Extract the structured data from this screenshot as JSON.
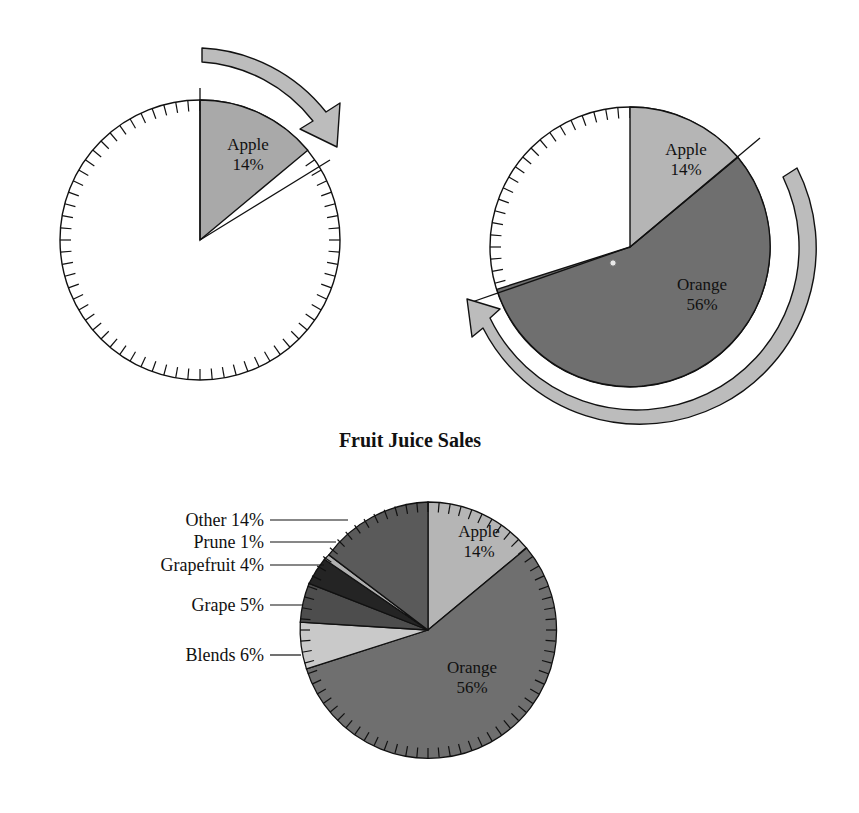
{
  "figure": {
    "title": "Fruit Juice Sales",
    "clipped_header_text": "ggg g ggg g g ggg"
  },
  "colors": {
    "apple": "#a9a9a9",
    "apple_light": "#b5b5b5",
    "orange": "#6f6f6f",
    "blends": "#c9c9c9",
    "grape": "#4d4d4d",
    "grapefruit": "#242424",
    "prune": "#b0b0b0",
    "other": "#5a5a5a",
    "outline": "#111111",
    "arrow_fill": "#bcbcbc",
    "arrow_outline": "#111111",
    "background": "#ffffff"
  },
  "panels": [
    {
      "name": "panel-step-1",
      "center": {
        "x": 200,
        "y": 240
      },
      "radius": 140,
      "slices": [
        {
          "key": "apple",
          "label": "Apple",
          "percent_label": "14%",
          "value": 14,
          "color": "#a9a9a9",
          "start_deg": 0,
          "end_deg": 50.4,
          "label_x": 248,
          "label_y": 150
        }
      ],
      "arrow": {
        "name": "rotation-arrow-apple",
        "direction": "clockwise",
        "from_deg": 0,
        "to_deg": 50.4
      }
    },
    {
      "name": "panel-step-2",
      "center": {
        "x": 630,
        "y": 247
      },
      "radius": 140,
      "slices": [
        {
          "key": "apple",
          "label": "Apple",
          "percent_label": "14%",
          "value": 14,
          "color": "#b5b5b5",
          "start_deg": 0,
          "end_deg": 50.4,
          "label_x": 684,
          "label_y": 152
        },
        {
          "key": "orange",
          "label": "Orange",
          "percent_label": "56%",
          "value": 56,
          "color": "#6f6f6f",
          "start_deg": 50.4,
          "end_deg": 252.0,
          "label_x": 700,
          "label_y": 290
        }
      ],
      "arrow": {
        "name": "rotation-arrow-orange",
        "direction": "clockwise",
        "from_deg": 50.4,
        "to_deg": 252.0
      }
    },
    {
      "name": "panel-final-pie",
      "center": {
        "x": 428,
        "y": 630
      },
      "radius": 128,
      "title_position": {
        "x": 410,
        "y": 447
      },
      "slices": [
        {
          "key": "apple",
          "label": "Apple",
          "percent_label": "14%",
          "value": 14,
          "color": "#b5b5b5",
          "start_deg": 0,
          "end_deg": 50.4,
          "label_x": 477,
          "label_y": 534,
          "label_mode": "inside"
        },
        {
          "key": "orange",
          "label": "Orange",
          "percent_label": "56%",
          "value": 56,
          "color": "#6f6f6f",
          "start_deg": 50.4,
          "end_deg": 252.0,
          "label_x": 470,
          "label_y": 672,
          "label_mode": "inside"
        },
        {
          "key": "blends",
          "label": "Blends",
          "percent_label": "6%",
          "value": 6,
          "color": "#c9c9c9",
          "start_deg": 252.0,
          "end_deg": 273.6,
          "label_mode": "callout",
          "callout_text": "Blends 6%",
          "text_x": 252,
          "text_y": 660,
          "leader_x1": 264,
          "leader_x2": 312,
          "leader_y": 655
        },
        {
          "key": "grape",
          "label": "Grape",
          "percent_label": "5%",
          "value": 5,
          "color": "#4d4d4d",
          "start_deg": 273.6,
          "end_deg": 291.6,
          "label_mode": "callout",
          "callout_text": "Grape 5%",
          "text_x": 252,
          "text_y": 610,
          "leader_x1": 264,
          "leader_x2": 305,
          "leader_y": 604
        },
        {
          "key": "grapefruit",
          "label": "Grapefruit",
          "percent_label": "4%",
          "value": 4,
          "color": "#242424",
          "start_deg": 291.6,
          "end_deg": 306.0,
          "label_mode": "callout",
          "callout_text": "Grapefruit 4%",
          "text_x": 252,
          "text_y": 570,
          "leader_x1": 264,
          "leader_x2": 320,
          "leader_y": 564
        },
        {
          "key": "prune",
          "label": "Prune",
          "percent_label": "1%",
          "value": 1,
          "color": "#b0b0b0",
          "start_deg": 306.0,
          "end_deg": 309.6,
          "label_mode": "callout",
          "callout_text": "Prune 1%",
          "text_x": 252,
          "text_y": 548,
          "leader_x1": 264,
          "leader_x2": 333,
          "leader_y": 542
        },
        {
          "key": "other",
          "label": "Other",
          "percent_label": "14%",
          "value": 14,
          "color": "#5a5a5a",
          "start_deg": 309.6,
          "end_deg": 360.0,
          "label_mode": "callout",
          "callout_text": "Other 14%",
          "text_x": 252,
          "text_y": 526,
          "leader_x1": 264,
          "leader_x2": 345,
          "leader_y": 520
        }
      ]
    }
  ],
  "chart_data": {
    "type": "pie",
    "title": "Fruit Juice Sales",
    "xlabel": "",
    "ylabel": "",
    "legend_position": "callout-labels-left",
    "grid": false,
    "units": "percent",
    "categories": [
      "Apple",
      "Orange",
      "Blends",
      "Grape",
      "Grapefruit",
      "Prune",
      "Other"
    ],
    "values": [
      14,
      56,
      6,
      5,
      4,
      1,
      14
    ],
    "labels": [
      "Apple 14%",
      "Orange 56%",
      "Blends 6%",
      "Grape 5%",
      "Grapefruit 4%",
      "Prune 1%",
      "Other 14%"
    ],
    "slice_colors": [
      "#b5b5b5",
      "#6f6f6f",
      "#c9c9c9",
      "#4d4d4d",
      "#242424",
      "#b0b0b0",
      "#5a5a5a"
    ],
    "start_angle_deg": 0,
    "direction": "clockwise",
    "total": 100,
    "annotations": [
      "Step 1: Apple 14% wedge drawn from 12 o'clock, rotating clockwise.",
      "Step 2: Orange 56% wedge added after Apple, rotating clockwise.",
      "Final: complete Fruit Juice Sales pie with all seven categories."
    ]
  }
}
